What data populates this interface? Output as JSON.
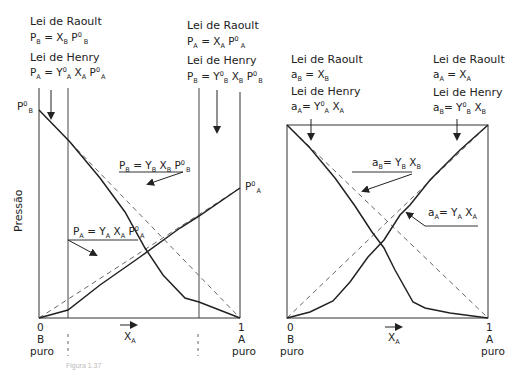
{
  "left_chart": {
    "ylabel": "Pressão",
    "top_left_label": {
      "title": "Lei de Raoult",
      "eq": [
        "P",
        "B",
        " = X",
        "B",
        " P",
        "0",
        "B"
      ]
    },
    "top_left_henry": {
      "title": "Lei de Henry",
      "eq": [
        "P",
        "A",
        " = Y",
        "0",
        "A",
        " X",
        "A",
        " P",
        "0",
        "A"
      ]
    },
    "top_right_label": {
      "title": "Lei de Raoult",
      "eq": [
        "P",
        "A",
        " = X",
        "A",
        " P",
        "0",
        "A"
      ]
    },
    "top_right_henry": {
      "title": "Lei de Henry",
      "eq": [
        "P",
        "B",
        " = Y",
        "0",
        "B",
        " X",
        "B",
        " P",
        "0",
        "B"
      ]
    },
    "pure_B_pressure": [
      "P",
      "0",
      "B"
    ],
    "pure_A_pressure": [
      "P",
      "0",
      "A"
    ],
    "curve_B_label": [
      "P",
      "B",
      " = Y",
      "B",
      " X",
      "B",
      " P",
      "0",
      "B"
    ],
    "curve_A_label": [
      "P",
      "A",
      " = Y",
      "A",
      " X",
      "A",
      " P",
      "0",
      "A"
    ],
    "x_axis": {
      "start": "0",
      "end": "1",
      "start_sub": "B",
      "start_sub2": "puro",
      "end_sub": "A",
      "end_sub2": "puro",
      "var": "X",
      "var_sub": "A"
    }
  },
  "right_chart": {
    "top_left_label": {
      "title": "Lei de Raoult",
      "eq": [
        "a",
        "B",
        " = X",
        "B"
      ]
    },
    "top_left_henry": {
      "title": "Lei de Henry",
      "eq": [
        "a",
        "A",
        "= Y",
        "0",
        "A",
        " X",
        "A"
      ]
    },
    "top_right_label": {
      "title": "Lei de Raoult",
      "eq": [
        "a",
        "A",
        " = X",
        "A"
      ]
    },
    "top_right_henry": {
      "title": "Lei de Henry",
      "eq": [
        "a",
        "B",
        "= Y",
        "0",
        "B",
        " X",
        "B"
      ]
    },
    "curve_B_label": [
      "a",
      "B",
      "= Y",
      "B",
      " X",
      "B"
    ],
    "curve_A_label": [
      "a",
      "A",
      "= Y",
      "A",
      " X",
      "A"
    ],
    "x_axis": {
      "start": "0",
      "end": "1",
      "start_sub": "B",
      "start_sub2": "puro",
      "end_sub": "A",
      "end_sub2": "puro",
      "var": "X",
      "var_sub": "A"
    }
  },
  "caption": "Figura 1.37",
  "colors": {
    "line": "#222222",
    "dashed": "#555555",
    "caption": "#bbbbbb"
  }
}
